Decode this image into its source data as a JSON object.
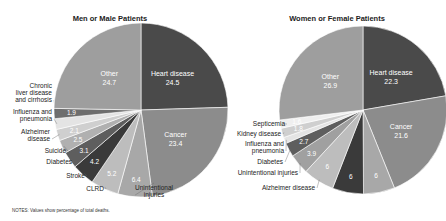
{
  "notes": "NOTES: Values show percentage of total deaths.",
  "chart_data": [
    {
      "type": "pie",
      "title": "Men or Male Patients",
      "unit": "percent of total deaths",
      "slices": [
        {
          "label": "Heart disease",
          "value": 24.5,
          "color": "#4a4a4a"
        },
        {
          "label": "Cancer",
          "value": 23.4,
          "color": "#8c8c8c"
        },
        {
          "label": "Unintentional injuries",
          "value": 6.4,
          "color": "#a8a8a8"
        },
        {
          "label": "CLRD",
          "value": 5.2,
          "color": "#bdbdbd"
        },
        {
          "label": "Stroke",
          "value": 4.2,
          "color": "#3a3a3a"
        },
        {
          "label": "Diabetes",
          "value": 3.1,
          "color": "#5e5e5e"
        },
        {
          "label": "Suicide",
          "value": 2.5,
          "color": "#b0b0b0"
        },
        {
          "label": "Alzheimer disease",
          "value": 2.1,
          "color": "#cfcfcf"
        },
        {
          "label": "Influenza and pneumonia",
          "value": 2.0,
          "color": "#e4e4e4",
          "value_label_visible": false
        },
        {
          "label": "Chronic liver disease and cirrhosis",
          "value": 1.9,
          "color": "#6e6e6e"
        },
        {
          "label": "Other",
          "value": 24.7,
          "color": "#9e9e9e"
        }
      ]
    },
    {
      "type": "pie",
      "title": "Women or Female Patients",
      "unit": "percent of total deaths",
      "slices": [
        {
          "label": "Heart disease",
          "value": 22.3,
          "color": "#4a4a4a"
        },
        {
          "label": "Cancer",
          "value": 21.6,
          "color": "#8c8c8c"
        },
        {
          "label": "CLRD",
          "value": 6.0,
          "color": "#a8a8a8"
        },
        {
          "label": "Stroke",
          "value": 6.0,
          "color": "#3a3a3a"
        },
        {
          "label": "Alzheimer disease",
          "value": 6.0,
          "color": "#bdbdbd"
        },
        {
          "label": "Unintentional injuries",
          "value": 3.9,
          "color": "#a0a0a0"
        },
        {
          "label": "Diabetes",
          "value": 2.7,
          "color": "#5e5e5e"
        },
        {
          "label": "Influenza and pneumonia",
          "value": 1.2,
          "color": "#e4e4e4",
          "value_label_visible": false
        },
        {
          "label": "Kidney disease",
          "value": 1.8,
          "color": "#cfcfcf"
        },
        {
          "label": "Septicemia",
          "value": 1.6,
          "color": "#efefef"
        },
        {
          "label": "Other",
          "value": 26.9,
          "color": "#9e9e9e"
        }
      ]
    }
  ]
}
